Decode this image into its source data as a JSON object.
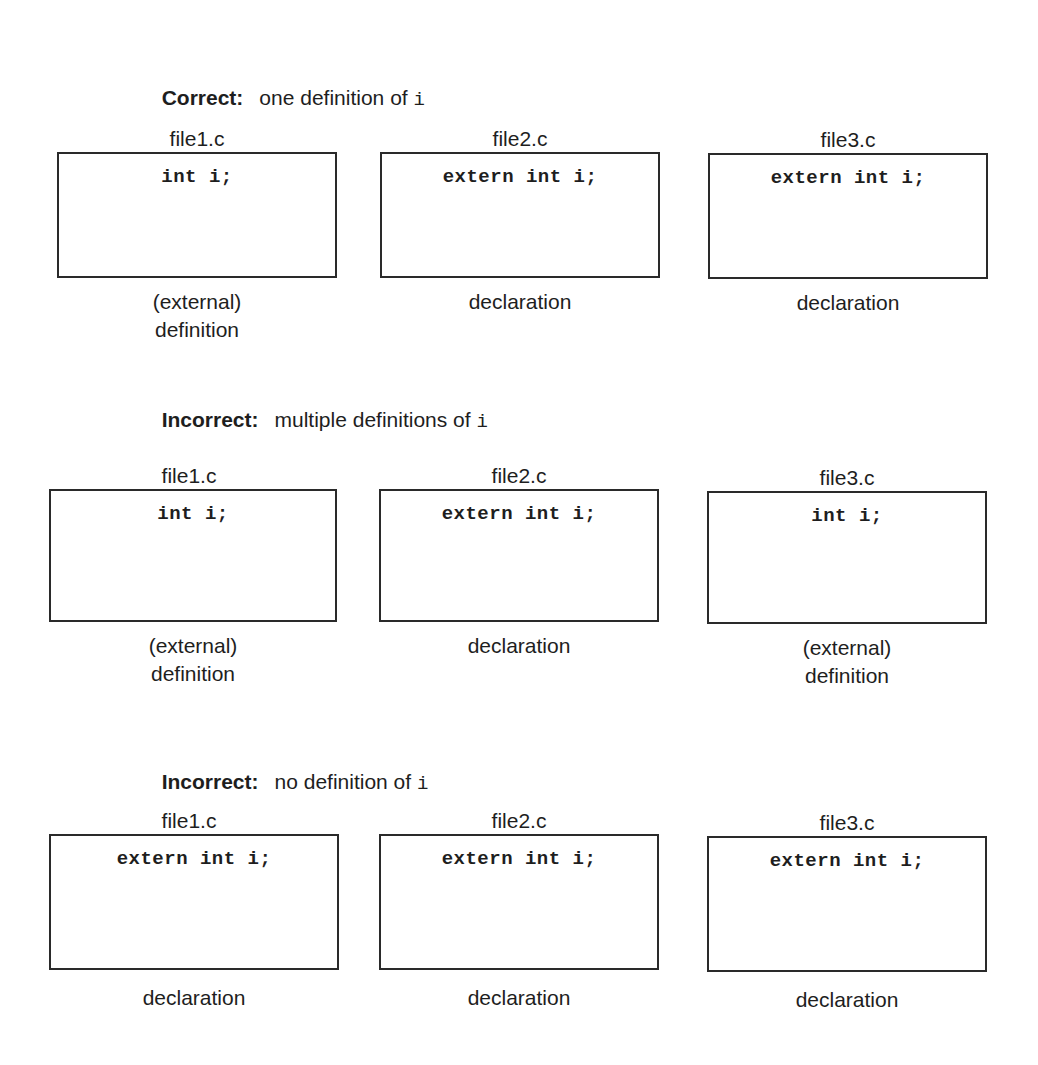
{
  "sections": [
    {
      "status": "Correct:",
      "description": "one definition of ",
      "symbol": "i",
      "files": [
        {
          "name": "file1.c",
          "code": "int i;",
          "caption_lines": [
            "(external)",
            "definition"
          ]
        },
        {
          "name": "file2.c",
          "code": "extern int i;",
          "caption_lines": [
            "declaration",
            ""
          ]
        },
        {
          "name": "file3.c",
          "code": "extern int i;",
          "caption_lines": [
            "declaration",
            ""
          ]
        }
      ]
    },
    {
      "status": "Incorrect:",
      "description": "multiple definitions of ",
      "symbol": "i",
      "files": [
        {
          "name": "file1.c",
          "code": "int i;",
          "caption_lines": [
            "(external)",
            "definition"
          ]
        },
        {
          "name": "file2.c",
          "code": "extern int i;",
          "caption_lines": [
            "declaration",
            ""
          ]
        },
        {
          "name": "file3.c",
          "code": "int i;",
          "caption_lines": [
            "(external)",
            "definition"
          ]
        }
      ]
    },
    {
      "status": "Incorrect:",
      "description": "no definition of ",
      "symbol": "i",
      "files": [
        {
          "name": "file1.c",
          "code": "extern int i;",
          "caption_lines": [
            "declaration",
            ""
          ]
        },
        {
          "name": "file2.c",
          "code": "extern int i;",
          "caption_lines": [
            "declaration",
            ""
          ]
        },
        {
          "name": "file3.c",
          "code": "extern int i;",
          "caption_lines": [
            "declaration",
            ""
          ]
        }
      ]
    }
  ]
}
